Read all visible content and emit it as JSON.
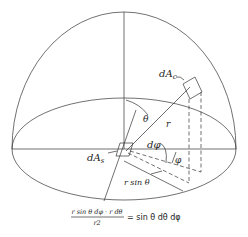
{
  "diagram": {
    "labels": {
      "dAc": "dA",
      "dAc_sub": "c",
      "dAs": "dA",
      "dAs_sub": "s",
      "theta": "θ",
      "r": "r",
      "dphi": "dφ",
      "phi": "φ",
      "r_sin_theta": "r sin θ"
    },
    "equation": {
      "numerator": "r sin θ dφ · r dθ",
      "denominator": "r2",
      "rhs": "= sin θ dθ dφ"
    },
    "colors": {
      "line": "#333333",
      "background": "#ffffff"
    }
  }
}
